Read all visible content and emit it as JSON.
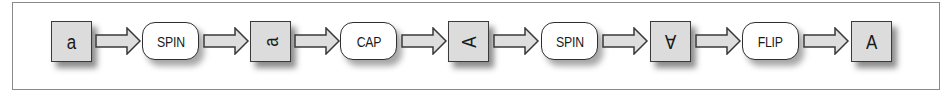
{
  "diagram": {
    "type": "flow",
    "direction": "left-to-right",
    "colors": {
      "frame_border": "#8a8a8a",
      "box_fill": "#dcdcdc",
      "box_border": "#3a3a3a",
      "pill_fill": "#ffffff",
      "pill_border": "#2e2e2e",
      "arrow_fill": "#dedede",
      "arrow_stroke": "#3a3a3a"
    },
    "nodes": [
      {
        "kind": "state",
        "label": "a",
        "orientation": "upright"
      },
      {
        "kind": "operation",
        "label": "SPIN"
      },
      {
        "kind": "state",
        "label": "a",
        "orientation": "rotated-90"
      },
      {
        "kind": "operation",
        "label": "CAP"
      },
      {
        "kind": "state",
        "label": "A",
        "orientation": "rotated-90"
      },
      {
        "kind": "operation",
        "label": "SPIN"
      },
      {
        "kind": "state",
        "label": "A",
        "orientation": "rotated-180"
      },
      {
        "kind": "operation",
        "label": "FLIP"
      },
      {
        "kind": "state",
        "label": "A",
        "orientation": "upright"
      }
    ],
    "edges": [
      {
        "from": 0,
        "to": 1
      },
      {
        "from": 1,
        "to": 2
      },
      {
        "from": 2,
        "to": 3
      },
      {
        "from": 3,
        "to": 4
      },
      {
        "from": 4,
        "to": 5
      },
      {
        "from": 5,
        "to": 6
      },
      {
        "from": 6,
        "to": 7
      },
      {
        "from": 7,
        "to": 8
      }
    ]
  }
}
